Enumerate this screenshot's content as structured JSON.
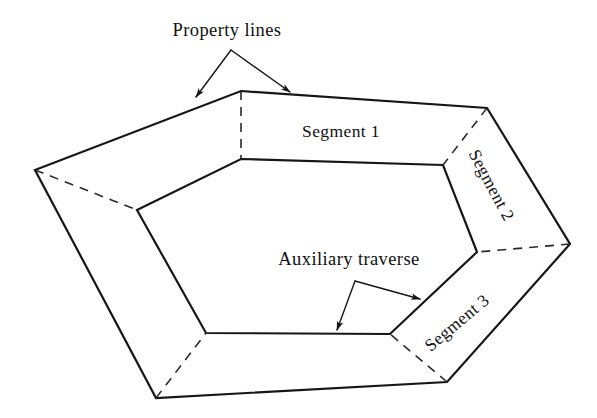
{
  "figure": {
    "width": 597,
    "height": 418,
    "background_color": "#ffffff",
    "line_color": "#161616",
    "dashed_color": "#2a2a2a",
    "text_color": "#101010"
  },
  "labels": {
    "property_lines": "Property lines",
    "auxiliary_traverse": "Auxiliary traverse",
    "segment_1": "Segment 1",
    "segment_2": "Segment 2",
    "segment_3": "Segment 3"
  },
  "geometry": {
    "outer_polygon": {
      "name": "property-lines-polygon",
      "style": "solid",
      "points": [
        [
          35,
          170
        ],
        [
          241,
          91
        ],
        [
          487,
          108
        ],
        [
          570,
          244
        ],
        [
          447,
          382
        ],
        [
          156,
          398
        ]
      ]
    },
    "inner_polygon": {
      "name": "auxiliary-traverse-polygon",
      "style": "solid",
      "points": [
        [
          137,
          210
        ],
        [
          241,
          159
        ],
        [
          443,
          165
        ],
        [
          477,
          252
        ],
        [
          390,
          334
        ],
        [
          206,
          333
        ]
      ]
    },
    "connectors": {
      "name": "dashed-connectors",
      "style": "dashed",
      "segments": [
        [
          [
            35,
            170
          ],
          [
            137,
            210
          ]
        ],
        [
          [
            241,
            91
          ],
          [
            241,
            159
          ]
        ],
        [
          [
            487,
            108
          ],
          [
            443,
            165
          ]
        ],
        [
          [
            570,
            244
          ],
          [
            477,
            252
          ]
        ],
        [
          [
            447,
            382
          ],
          [
            390,
            334
          ]
        ],
        [
          [
            156,
            398
          ],
          [
            206,
            333
          ]
        ]
      ]
    }
  },
  "callouts": {
    "property_lines": {
      "text_anchor": [
        227,
        36
      ],
      "branch_point": [
        231,
        50
      ],
      "arrows": [
        {
          "from": [
            231,
            50
          ],
          "to": [
            196,
            97
          ],
          "name": "property-lines-arrow-left"
        },
        {
          "from": [
            231,
            50
          ],
          "to": [
            290,
            92
          ],
          "name": "property-lines-arrow-right"
        }
      ]
    },
    "auxiliary_traverse": {
      "text_anchor": [
        349,
        265
      ],
      "branch_point": [
        355,
        281
      ],
      "arrows": [
        {
          "from": [
            355,
            281
          ],
          "to": [
            337,
            330
          ],
          "name": "auxiliary-traverse-arrow-left"
        },
        {
          "from": [
            355,
            281
          ],
          "to": [
            420,
            299
          ],
          "name": "auxiliary-traverse-arrow-right"
        }
      ]
    }
  },
  "segment_labels": [
    {
      "key": "segment_1",
      "name": "segment-1-label",
      "x": 341,
      "y": 133,
      "rotation": 0
    },
    {
      "key": "segment_2",
      "name": "segment-2-label",
      "x": 490,
      "y": 186,
      "rotation": 62
    },
    {
      "key": "segment_3",
      "name": "segment-3-label",
      "x": 458,
      "y": 324,
      "rotation": -40
    }
  ]
}
